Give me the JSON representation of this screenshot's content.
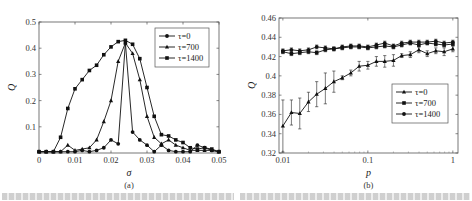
{
  "figure": {
    "panels": [
      {
        "id": "a",
        "sub_label": "(a)"
      },
      {
        "id": "b",
        "sub_label": "(b)"
      }
    ]
  },
  "chart_data": [
    {
      "panel": "(a)",
      "type": "line",
      "title": "",
      "xlabel": "σ",
      "ylabel": "Q",
      "xlim": [
        0,
        0.05
      ],
      "ylim": [
        0,
        0.5
      ],
      "xticks": [
        0,
        0.01,
        0.02,
        0.03,
        0.04,
        0.05
      ],
      "xtick_labels": [
        "0",
        "0.01",
        "0.02",
        "0.03",
        "0.04",
        "0.05"
      ],
      "yticks": [
        0,
        0.1,
        0.2,
        0.3,
        0.4,
        0.5
      ],
      "ytick_labels": [
        "",
        "0.1",
        "0.2",
        "0.3",
        "0.4",
        "0.5"
      ],
      "grid": false,
      "legend_position": "upper right",
      "x": [
        0,
        0.002,
        0.004,
        0.006,
        0.008,
        0.01,
        0.012,
        0.014,
        0.016,
        0.018,
        0.02,
        0.022,
        0.024,
        0.026,
        0.028,
        0.03,
        0.032,
        0.034,
        0.036,
        0.038,
        0.04,
        0.042,
        0.044,
        0.046,
        0.048,
        0.05
      ],
      "series": [
        {
          "name": "τ=0",
          "marker": "circle",
          "values": [
            0.005,
            0.005,
            0.005,
            0.005,
            0.005,
            0.005,
            0.01,
            0.005,
            0.01,
            0.02,
            0.05,
            0.035,
            0.42,
            0.08,
            0.05,
            0.03,
            0.005,
            0.03,
            0.01,
            0.005,
            0.005,
            0.005,
            0.03,
            0.02,
            0.01,
            0.005
          ]
        },
        {
          "name": "τ=700",
          "marker": "triangle",
          "values": [
            0.005,
            0.005,
            0.005,
            0.005,
            0.03,
            0.01,
            0.015,
            0.02,
            0.05,
            0.12,
            0.2,
            0.35,
            0.42,
            0.38,
            0.28,
            0.14,
            0.06,
            0.035,
            0.05,
            0.03,
            0.02,
            0.01,
            0.01,
            0.01,
            0.01,
            0.005
          ]
        },
        {
          "name": "τ=1400",
          "marker": "square",
          "values": [
            0.005,
            0.005,
            0.005,
            0.06,
            0.17,
            0.245,
            0.28,
            0.315,
            0.335,
            0.375,
            0.405,
            0.425,
            0.43,
            0.415,
            0.36,
            0.25,
            0.14,
            0.07,
            0.065,
            0.05,
            0.04,
            0.02,
            0.015,
            0.02,
            0.015,
            0.005
          ]
        }
      ]
    },
    {
      "panel": "(b)",
      "type": "line",
      "title": "",
      "xlabel": "p",
      "ylabel": "Q",
      "xscale": "log",
      "xlim": [
        0.009,
        1.15
      ],
      "ylim": [
        0.32,
        0.46
      ],
      "xticks": [
        0.01,
        0.1,
        1
      ],
      "xtick_labels": [
        "0.01",
        "0.1",
        "1"
      ],
      "yticks": [
        0.32,
        0.34,
        0.36,
        0.38,
        0.4,
        0.42,
        0.44,
        0.46
      ],
      "ytick_labels": [
        "0.32",
        "0.34",
        "0.36",
        "0.38",
        "0.4",
        "0.42",
        "0.44",
        "0.46"
      ],
      "grid": false,
      "error_bars": true,
      "legend_position": "center right",
      "x": [
        0.01,
        0.0126,
        0.0158,
        0.02,
        0.025,
        0.0316,
        0.0398,
        0.05,
        0.063,
        0.079,
        0.1,
        0.126,
        0.158,
        0.2,
        0.25,
        0.316,
        0.398,
        0.5,
        0.63,
        0.79,
        1.0
      ],
      "series": [
        {
          "name": "τ=0",
          "marker": "triangle",
          "values": [
            0.348,
            0.362,
            0.361,
            0.373,
            0.381,
            0.387,
            0.394,
            0.398,
            0.403,
            0.41,
            0.411,
            0.415,
            0.415,
            0.416,
            0.421,
            0.422,
            0.427,
            0.423,
            0.426,
            0.425,
            0.428
          ],
          "errors": [
            0.027,
            0.013,
            0.016,
            0.01,
            0.013,
            0.016,
            0.011,
            0.002,
            0.003,
            0.005,
            0.004,
            0.005,
            0.006,
            0.006,
            0.002,
            0.003,
            0.003,
            0.003,
            0.003,
            0.004,
            0.003
          ]
        },
        {
          "name": "τ=700",
          "marker": "square",
          "values": [
            0.425,
            0.423,
            0.424,
            0.425,
            0.424,
            0.427,
            0.428,
            0.429,
            0.43,
            0.43,
            0.429,
            0.43,
            0.431,
            0.43,
            0.432,
            0.434,
            0.432,
            0.434,
            0.433,
            0.432,
            0.433
          ],
          "errors": [
            0.002,
            0.002,
            0.002,
            0.002,
            0.002,
            0.002,
            0.002,
            0.002,
            0.002,
            0.002,
            0.002,
            0.002,
            0.002,
            0.002,
            0.002,
            0.002,
            0.002,
            0.002,
            0.002,
            0.002,
            0.002
          ]
        },
        {
          "name": "τ=1400",
          "marker": "circle",
          "values": [
            0.426,
            0.427,
            0.426,
            0.427,
            0.43,
            0.429,
            0.428,
            0.43,
            0.431,
            0.431,
            0.43,
            0.432,
            0.434,
            0.431,
            0.434,
            0.435,
            0.435,
            0.435,
            0.436,
            0.434,
            0.435
          ],
          "errors": [
            0.002,
            0.002,
            0.002,
            0.002,
            0.002,
            0.002,
            0.002,
            0.002,
            0.002,
            0.002,
            0.002,
            0.002,
            0.002,
            0.002,
            0.002,
            0.002,
            0.002,
            0.002,
            0.002,
            0.002,
            0.002
          ]
        }
      ]
    }
  ]
}
